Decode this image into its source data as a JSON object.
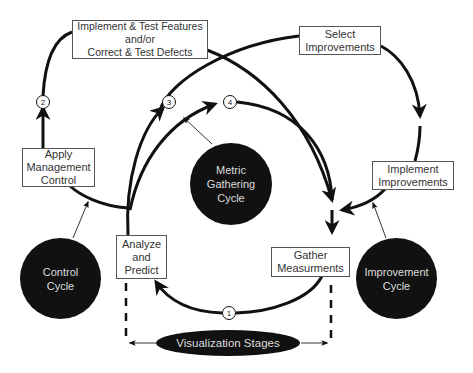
{
  "diagram": {
    "process_boxes": {
      "implement_test": [
        "Implement & Test Features",
        "and/or",
        "Correct & Test Defects"
      ],
      "select_improvements": [
        "Select",
        "Improvements"
      ],
      "apply_management": [
        "Apply",
        "Management",
        "Control"
      ],
      "implement_improvements": [
        "Implement",
        "Improvements"
      ],
      "analyze_predict": [
        "Analyze",
        "and",
        "Predict"
      ],
      "gather_measurements": [
        "Gather",
        "Measurments"
      ]
    },
    "cycles": {
      "metric": [
        "Metric",
        "Gathering",
        "Cycle"
      ],
      "control": [
        "Control",
        "Cycle"
      ],
      "improvement": [
        "Improvement",
        "Cycle"
      ]
    },
    "stage_markers": [
      "1",
      "2",
      "3",
      "4"
    ],
    "visualization": "Visualization Stages",
    "colors": {
      "line": "#111111",
      "blob": "#111111",
      "blob_text": "#dddddd",
      "box_border": "#555555"
    }
  }
}
